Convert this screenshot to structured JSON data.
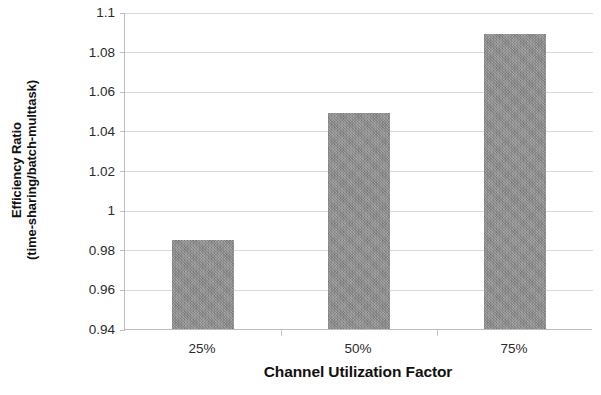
{
  "chart_data": {
    "type": "bar",
    "title": "",
    "categories": [
      "25%",
      "50%",
      "75%"
    ],
    "values": [
      0.985,
      1.049,
      1.089
    ],
    "series": [
      {
        "name": "Efficiency Ratio",
        "values": [
          0.985,
          1.049,
          1.089
        ]
      }
    ],
    "xlabel": "Channel Utilization Factor",
    "ylabel_line1": "Efficiency Ratio",
    "ylabel_line2": "(time-sharing/batch-multtask)",
    "ylim": [
      0.94,
      1.1
    ],
    "ytick_values": [
      1.1,
      1.08,
      1.06,
      1.04,
      1.02,
      1,
      0.98,
      0.96,
      0.94
    ],
    "ytick_labels": [
      "1.1",
      "1.08",
      "1.06",
      "1.04",
      "1.02",
      "1",
      "0.98",
      "0.96",
      "0.94"
    ],
    "grid": true,
    "grid_axis": "y",
    "legend": false,
    "legend_position": "none",
    "bar_color": "#8d8d8d",
    "gridline_color": "#dadada",
    "axis_color": "#bdbdbd",
    "text_color": "#111111"
  }
}
